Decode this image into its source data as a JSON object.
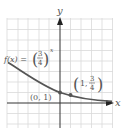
{
  "diagram": {
    "type": "function-graph",
    "function_label": {
      "prefix": "f(x) = ",
      "base_numerator": "3",
      "base_denominator": "4",
      "exponent": "x"
    },
    "axes": {
      "x_label": "x",
      "y_label": "y"
    },
    "points": [
      {
        "label": "(0, 1)",
        "x": 0,
        "y": 1
      },
      {
        "label_prefix": "(1, ",
        "numerator": "3",
        "denominator": "4",
        "label_suffix": ")",
        "x": 1,
        "y": 0.75
      }
    ],
    "colors": {
      "grid": "#d9d9d9",
      "axis": "#333333",
      "curve": "#555555",
      "text": "#555555",
      "point": "#555555"
    }
  }
}
